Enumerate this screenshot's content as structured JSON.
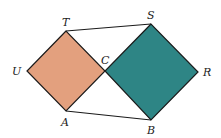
{
  "diagram": {
    "colors": {
      "left_square": "#e3a07e",
      "right_square": "#2e8585",
      "stroke": "#1a1a1a"
    },
    "points": {
      "T": {
        "label": "T",
        "x": 66,
        "y": 31
      },
      "U": {
        "label": "U",
        "x": 27,
        "y": 71
      },
      "A": {
        "label": "A",
        "x": 66,
        "y": 111
      },
      "C": {
        "label": "C",
        "x": 105,
        "y": 71
      },
      "S": {
        "label": "S",
        "x": 151,
        "y": 24
      },
      "R": {
        "label": "R",
        "x": 198,
        "y": 72
      },
      "B": {
        "label": "B",
        "x": 151,
        "y": 120
      }
    },
    "shapes": [
      {
        "name": "square-TUAC",
        "vertices": [
          "T",
          "U",
          "A",
          "C"
        ],
        "fill": "left_square"
      },
      {
        "name": "square-SCBR",
        "vertices": [
          "S",
          "C",
          "B",
          "R"
        ],
        "fill": "right_square"
      }
    ],
    "segments": [
      [
        "T",
        "S"
      ],
      [
        "A",
        "B"
      ]
    ]
  }
}
